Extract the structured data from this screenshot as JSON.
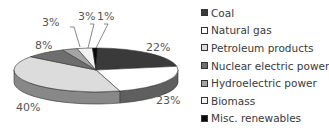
{
  "chart_data": {
    "type": "pie",
    "style": "3d",
    "title": "",
    "categories": [
      "Coal",
      "Natural gas",
      "Petroleum products",
      "Nuclear electric power",
      "Hydroelectric power",
      "Biomass",
      "Misc. renewables"
    ],
    "values": [
      22,
      23,
      40,
      8,
      3,
      3,
      1
    ],
    "unit": "%",
    "colors": [
      "#3a3a3a",
      "#ffffff",
      "#dcdcdc",
      "#6e6e6e",
      "#a5a5a5",
      "#f2f2f2",
      "#0a0a0a"
    ],
    "data_labels": [
      "22%",
      "23%",
      "40%",
      "8%",
      "3%",
      "3%",
      "1%"
    ],
    "legend_position": "right"
  },
  "legend": {
    "items": [
      {
        "label": "Coal",
        "color": "#3a3a3a"
      },
      {
        "label": "Natural gas",
        "color": "#ffffff"
      },
      {
        "label": "Petroleum products",
        "color": "#dcdcdc"
      },
      {
        "label": "Nuclear electric power",
        "color": "#6e6e6e"
      },
      {
        "label": "Hydroelectric power",
        "color": "#a5a5a5"
      },
      {
        "label": "Biomass",
        "color": "#f2f2f2"
      },
      {
        "label": "Misc. renewables",
        "color": "#0a0a0a"
      }
    ]
  },
  "labels": {
    "coal": "22%",
    "natural_gas": "23%",
    "petroleum": "40%",
    "nuclear": "8%",
    "hydro": "3%",
    "biomass": "3%",
    "misc": "1%"
  }
}
